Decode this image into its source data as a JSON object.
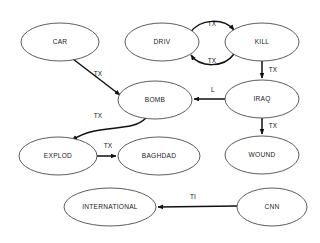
{
  "diagram": {
    "type": "directed-graph",
    "canvas": {
      "width": 320,
      "height": 243,
      "background": "#ffffff"
    },
    "style": {
      "node_fill": "#ffffff",
      "node_stroke": "#4a4a4a",
      "edge_color": "#111111",
      "label_color": "#1a1a1a"
    },
    "nodes": [
      {
        "id": "car",
        "label": "CAR",
        "cx": 60,
        "cy": 42,
        "rx": 39,
        "ry": 19
      },
      {
        "id": "driv",
        "label": "DRIV",
        "cx": 162,
        "cy": 42,
        "rx": 37,
        "ry": 19
      },
      {
        "id": "kill",
        "label": "KILL",
        "cx": 262,
        "cy": 42,
        "rx": 37,
        "ry": 19
      },
      {
        "id": "bomb",
        "label": "BOMB",
        "cx": 155,
        "cy": 100,
        "rx": 37,
        "ry": 19
      },
      {
        "id": "iraq",
        "label": "IRAQ",
        "cx": 262,
        "cy": 99,
        "rx": 37,
        "ry": 19
      },
      {
        "id": "explod",
        "label": "EXPLOD",
        "cx": 58,
        "cy": 156,
        "rx": 39,
        "ry": 19
      },
      {
        "id": "baghdad",
        "label": "BAGHDAD",
        "cx": 159,
        "cy": 156,
        "rx": 41,
        "ry": 19
      },
      {
        "id": "wound",
        "label": "WOUND",
        "cx": 262,
        "cy": 155,
        "rx": 37,
        "ry": 19
      },
      {
        "id": "international",
        "label": "INTERNATIONAL",
        "cx": 110,
        "cy": 207,
        "rx": 46,
        "ry": 19
      },
      {
        "id": "cnn",
        "label": "CNN",
        "cx": 272,
        "cy": 207,
        "rx": 35,
        "ry": 19
      }
    ],
    "edges": [
      {
        "id": "driv-kill-top",
        "from": "driv",
        "to": "kill",
        "label": "TX",
        "label_x": 212,
        "label_y": 24,
        "path": "M 190 33 C 200 18 224 18 234 30"
      },
      {
        "id": "kill-driv-bottom",
        "from": "kill",
        "to": "driv",
        "label": "TX",
        "label_y": 61,
        "label_x": 212,
        "path": "M 234 54 C 224 68 200 68 191 55"
      },
      {
        "id": "kill-iraq",
        "from": "kill",
        "to": "iraq",
        "label": "TX",
        "label_x": 273,
        "label_y": 70,
        "path": "M 262 61 L 262 78"
      },
      {
        "id": "iraq-bomb",
        "from": "iraq",
        "to": "bomb",
        "label": "L",
        "label_x": 213,
        "label_y": 90,
        "path": "M 225 99 L 194 99"
      },
      {
        "id": "iraq-wound",
        "from": "iraq",
        "to": "wound",
        "label": "TX",
        "label_x": 273,
        "label_y": 126,
        "path": "M 262 118 L 262 134"
      },
      {
        "id": "car-bomb",
        "from": "car",
        "to": "bomb",
        "label": "TX",
        "label_x": 98,
        "label_y": 74,
        "path": "M 73 59 L 120 95"
      },
      {
        "id": "bomb-explod",
        "from": "bomb",
        "to": "explod",
        "label": "TX",
        "label_x": 98,
        "label_y": 116,
        "path": "M 146 118 C 130 134 100 122 72 140"
      },
      {
        "id": "explod-baghdad",
        "from": "explod",
        "to": "baghdad",
        "label": "TX",
        "label_x": 108,
        "label_y": 146,
        "path": "M 97 156 L 116 156"
      },
      {
        "id": "cnn-international",
        "from": "cnn",
        "to": "international",
        "label": "TI",
        "label_x": 193,
        "label_y": 197,
        "path": "M 237 206 L 158 207"
      }
    ]
  }
}
